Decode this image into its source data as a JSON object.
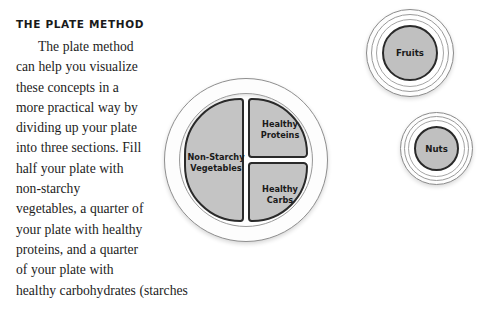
{
  "article": {
    "heading": "THE PLATE METHOD",
    "body_paragraph": "The plate method can help you visualize these concepts in a more practical way by dividing up your plate into three sections. Fill half your plate with non-starchy vegetables, a quarter of your plate with healthy proteins, and a quarter of your plate with",
    "body_last_line": "healthy carbohydrates (starches"
  },
  "diagram": {
    "plate": {
      "name": "plate-diagram",
      "segments": [
        {
          "id": "vegetables",
          "label_line1": "Non-Starchy",
          "label_line2": "Vegetables",
          "share": "one half"
        },
        {
          "id": "proteins",
          "label_line1": "Healthy",
          "label_line2": "Proteins",
          "share": "one quarter"
        },
        {
          "id": "carbs",
          "label_line1": "Healthy",
          "label_line2": "Carbs",
          "share": "one quarter"
        }
      ]
    },
    "side_bowls": [
      {
        "id": "fruits",
        "label": "Fruits"
      },
      {
        "id": "nuts",
        "label": "Nuts"
      }
    ]
  },
  "colors": {
    "segment_fill": "#c4c4c4",
    "segment_outline": "#2a2a2a",
    "bowl_fill": "#c0c0c0",
    "rim_stroke": "#8f8f8f",
    "text": "#1c1c1c",
    "page_background": "#ffffff"
  }
}
